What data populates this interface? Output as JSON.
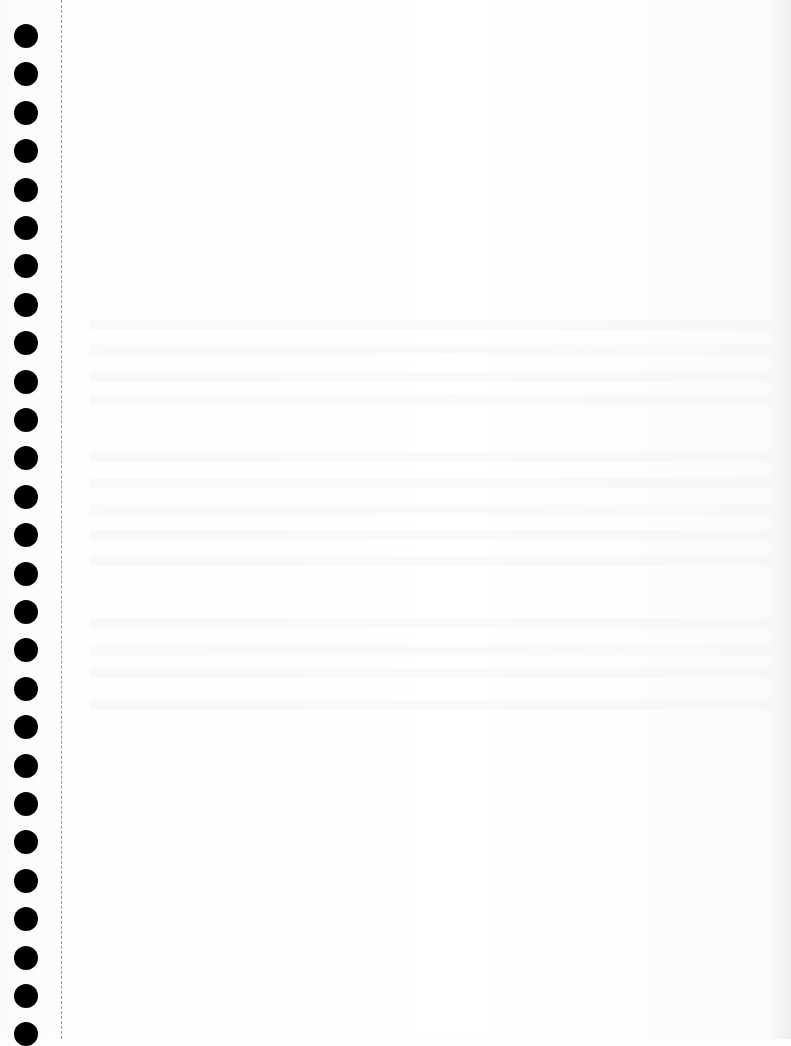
{
  "document": {
    "type": "blank scanned continuous-feed paper page",
    "holes": {
      "count": 27,
      "first_center_y": 36,
      "spacing": 38.4,
      "center_x": 26,
      "diameter": 24,
      "color": "#000000"
    },
    "perforation": {
      "x": 61,
      "color": "#9a9a9a"
    },
    "body_text": "",
    "bleed_through_rows": [
      320,
      345,
      372,
      395,
      452,
      478,
      505,
      530,
      556,
      618,
      645,
      668,
      700
    ]
  }
}
